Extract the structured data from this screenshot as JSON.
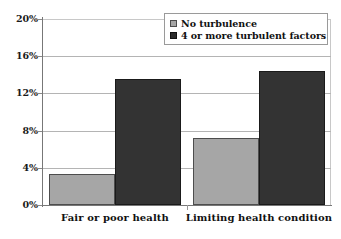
{
  "chart_data": {
    "type": "bar",
    "title": "",
    "xlabel": "",
    "ylabel": "",
    "categories": [
      "Fair or poor health",
      "Limiting health condition"
    ],
    "series": [
      {
        "name": "No turbulence",
        "color": "#a6a6a6",
        "values": [
          3.3,
          7.2
        ]
      },
      {
        "name": "4 or more turbulent factors",
        "color": "#333333",
        "values": [
          13.6,
          14.4
        ]
      }
    ],
    "ylim": [
      0,
      20
    ],
    "ytick_values": [
      0,
      4,
      8,
      12,
      16,
      20
    ],
    "ytick_labels": [
      "0%",
      "4%",
      "8%",
      "12%",
      "16%",
      "20%"
    ],
    "grid": true,
    "legend_position": "top-right"
  },
  "legend": {
    "items": [
      {
        "label": "No turbulence",
        "swatch": "light-gray-swatch"
      },
      {
        "label": "4 or more turbulent factors",
        "swatch": "dark-gray-swatch"
      }
    ]
  },
  "axes": {
    "y_labels": [
      "20%",
      "16%",
      "12%",
      "8%",
      "4%",
      "0%"
    ],
    "x_labels": [
      "Fair or poor health",
      "Limiting health condition"
    ]
  }
}
